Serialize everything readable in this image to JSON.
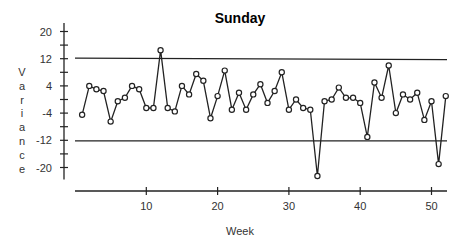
{
  "chart_data": {
    "type": "line",
    "title": "Sunday",
    "xlabel": "Week",
    "ylabel": "Variance",
    "xlim": [
      0,
      52
    ],
    "ylim": [
      -24,
      22
    ],
    "x_ticks": [
      10,
      20,
      30,
      40,
      50
    ],
    "y_ticks_labeled": [
      20,
      12,
      4,
      -4,
      -12,
      -20
    ],
    "y_ticks_minor_step": 4,
    "grid": false,
    "legend": null,
    "control_limits": {
      "upper": 12,
      "lower": -12
    },
    "series": [
      {
        "name": "Sunday variance",
        "marker": "open-circle",
        "x": [
          1,
          2,
          3,
          4,
          5,
          6,
          7,
          8,
          9,
          10,
          11,
          12,
          13,
          14,
          15,
          16,
          17,
          18,
          19,
          20,
          21,
          22,
          23,
          24,
          25,
          26,
          27,
          28,
          29,
          30,
          31,
          32,
          33,
          34,
          35,
          36,
          37,
          38,
          39,
          40,
          41,
          42,
          43,
          44,
          45,
          46,
          47,
          48,
          49,
          50,
          51,
          52
        ],
        "values": [
          -4.5,
          4,
          3,
          2.5,
          -6.5,
          -0.5,
          0.5,
          4,
          3,
          -2.5,
          -2.5,
          14.5,
          -2.5,
          -3.5,
          4,
          1.5,
          7.5,
          5.5,
          -5.5,
          1,
          8.5,
          -3,
          2,
          -3,
          1.5,
          4.5,
          -1,
          2.5,
          8,
          -3,
          0,
          -2.5,
          -3,
          -22.5,
          -0.5,
          0,
          3.5,
          0.5,
          0.5,
          -1,
          -11,
          5,
          0.5,
          10,
          -4,
          1.5,
          0,
          2,
          -6,
          -0.5,
          -19,
          1
        ]
      }
    ]
  },
  "colors": {
    "line": "#222222",
    "background": "#ffffff"
  }
}
